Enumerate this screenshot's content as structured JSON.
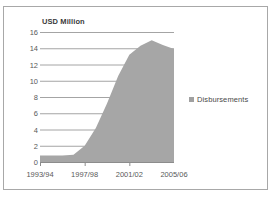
{
  "chart_data": {
    "type": "area",
    "title": "USD Million",
    "xlabel": "",
    "ylabel": "",
    "ylim": [
      0,
      16
    ],
    "ytick_values": [
      16,
      14,
      12,
      10,
      8,
      6,
      4,
      2,
      0
    ],
    "ytick_labels": [
      "16",
      "14",
      "12",
      "10",
      "8",
      "6",
      "4",
      "2",
      "0"
    ],
    "grid": true,
    "legend_position": "right",
    "legend_entries": [
      "Disbursements"
    ],
    "categories": [
      "1993/94",
      "1994/95",
      "1995/96",
      "1996/97",
      "1997/98",
      "1998/99",
      "1999/00",
      "2000/01",
      "2001/02",
      "2002/03",
      "2003/04",
      "2004/05",
      "2005/06"
    ],
    "xtick_labels": [
      "1993/94",
      "1997/98",
      "2001/02",
      "2005/06"
    ],
    "series": [
      {
        "name": "Disbursements",
        "color": "#a6a6a6",
        "values": [
          0.8,
          0.8,
          0.8,
          0.9,
          2.0,
          4.2,
          7.2,
          10.6,
          13.2,
          14.3,
          15.0,
          14.4,
          13.9
        ]
      }
    ],
    "final_value": 12.0
  },
  "legend": {
    "marker_icon": "square-marker-icon",
    "label": "Disbursements"
  },
  "colors": {
    "area_fill": "#a6a6a6",
    "gridline": "#9a9a9a",
    "axis": "#8c8c8c",
    "text": "#595959",
    "frame_border": "#a8a8a8"
  }
}
